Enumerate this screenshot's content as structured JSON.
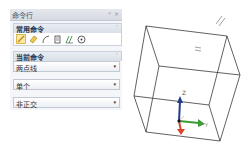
{
  "panel": {
    "title": "命令行",
    "pin_label": "ᵖ",
    "close_label": "×",
    "common_section": {
      "label": "常用命令",
      "collapse_icon": "˄",
      "tools": [
        {
          "name": "line-tool-icon",
          "active": true
        },
        {
          "name": "eraser-tool-icon",
          "active": false
        },
        {
          "name": "arc-tool-icon",
          "active": false
        },
        {
          "name": "document-tool-icon",
          "active": false
        },
        {
          "name": "dimension-tool-icon",
          "active": false
        },
        {
          "name": "circle-center-tool-icon",
          "active": false
        }
      ]
    },
    "current_section": {
      "label": "当前命令",
      "collapse_icon": "˄"
    },
    "dropdowns": [
      {
        "value": "两点线",
        "arrow": "▾"
      },
      {
        "value": "单个",
        "arrow": "▾"
      },
      {
        "value": "非正交",
        "arrow": "▾"
      }
    ]
  },
  "viewport": {
    "axis_labels": {
      "z": "Z",
      "y": "Y",
      "x": "X"
    },
    "axis_colors": {
      "z": "#1f3c8f",
      "y": "#3f9a3a",
      "x": "#d9452b"
    },
    "marker_text": "="
  }
}
